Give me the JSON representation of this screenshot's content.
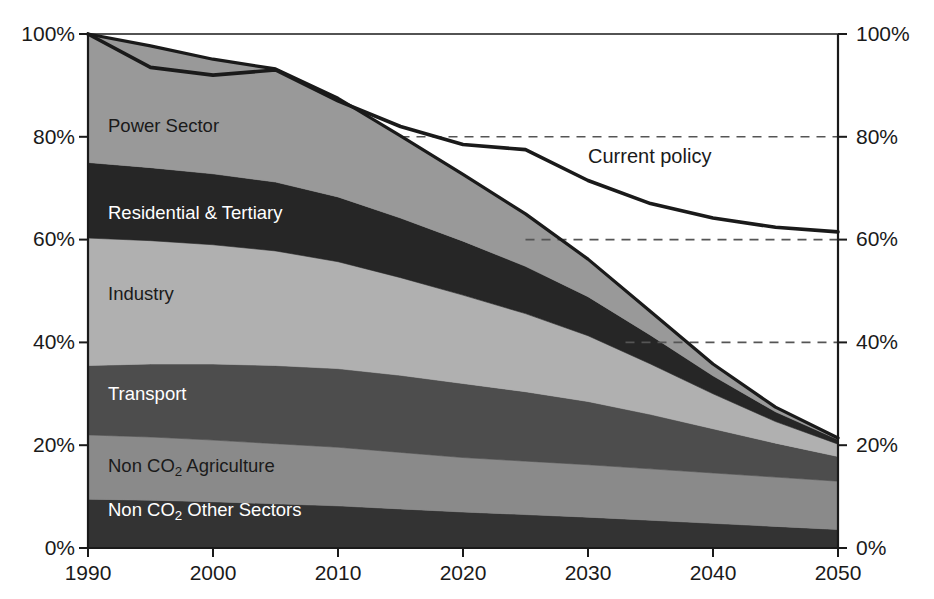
{
  "chart_data": {
    "type": "area",
    "title": "",
    "subtitle": "",
    "xlabel": "",
    "ylabel": "",
    "xlim": [
      1990,
      2050
    ],
    "ylim": [
      0,
      100
    ],
    "x": [
      1990,
      1995,
      2000,
      2005,
      2010,
      2015,
      2020,
      2025,
      2030,
      2035,
      2040,
      2045,
      2050
    ],
    "xticks": [
      "1990",
      "2000",
      "2010",
      "2020",
      "2030",
      "2040",
      "2050"
    ],
    "yticks_left": [
      "0%",
      "20%",
      "40%",
      "60%",
      "80%",
      "100%"
    ],
    "yticks_right": [
      "0%",
      "20%",
      "40%",
      "60%",
      "80%",
      "100%"
    ],
    "grid": "dashed horizontal gridlines at 40%, 60% and 80% on right half only",
    "legend_position": "inline band labels",
    "stack_order_bottom_to_top": [
      "Non CO2 Other Sectors",
      "Non CO2 Agriculture",
      "Transport",
      "Industry",
      "Residential & Tertiary",
      "Power Sector"
    ],
    "series": [
      {
        "name": "Non CO2 Other Sectors",
        "label": "Non CO",
        "label_sub": "2",
        "label_tail": " Other Sectors",
        "color": "#333333",
        "text_color": "#ffffff",
        "values": [
          9.5,
          9.3,
          9.0,
          8.6,
          8.2,
          7.6,
          7.0,
          6.5,
          6.0,
          5.4,
          4.8,
          4.2,
          3.6
        ]
      },
      {
        "name": "Non CO2 Agriculture",
        "label": "Non CO",
        "label_sub": "2",
        "label_tail": " Agriculture",
        "color": "#8a8a8a",
        "text_color": "#1a1a1a",
        "values": [
          12.5,
          12.3,
          12.0,
          11.7,
          11.4,
          11.0,
          10.6,
          10.4,
          10.2,
          10.0,
          9.8,
          9.6,
          9.4
        ]
      },
      {
        "name": "Transport",
        "label": "Transport",
        "color": "#4d4d4d",
        "text_color": "#ffffff",
        "values": [
          13.5,
          14.2,
          14.8,
          15.2,
          15.3,
          15.0,
          14.4,
          13.5,
          12.3,
          10.6,
          8.6,
          6.6,
          4.8
        ]
      },
      {
        "name": "Industry",
        "label": "Industry",
        "color": "#b0b0b0",
        "text_color": "#1a1a1a",
        "values": [
          24.8,
          24.0,
          23.2,
          22.3,
          20.8,
          19.0,
          17.2,
          15.2,
          12.8,
          9.8,
          6.8,
          4.2,
          2.4
        ]
      },
      {
        "name": "Residential & Tertiary",
        "label": "Residential & Tertiary",
        "color": "#262626",
        "text_color": "#ffffff",
        "values": [
          14.7,
          14.2,
          13.8,
          13.4,
          12.6,
          11.6,
          10.5,
          9.2,
          7.6,
          5.6,
          3.5,
          1.9,
          0.9
        ]
      },
      {
        "name": "Power Sector",
        "label": "Power Sector",
        "color": "#999999",
        "text_color": "#1a1a1a",
        "values": [
          25.0,
          23.7,
          22.3,
          22.0,
          19.2,
          16.0,
          13.0,
          10.2,
          7.3,
          4.6,
          2.3,
          0.9,
          0.3
        ]
      }
    ],
    "total_line": {
      "name": "Total emissions (stack top)",
      "color": "#1a1a1a",
      "values": [
        100.0,
        97.7,
        95.1,
        93.2,
        87.5,
        80.2,
        72.7,
        65.0,
        56.2,
        46.0,
        35.8,
        27.4,
        21.4
      ]
    },
    "overlay_line": {
      "name": "Current policy",
      "label": "Current policy",
      "color": "#1a1a1a",
      "x": [
        1990,
        1995,
        2000,
        2005,
        2010,
        2015,
        2020,
        2025,
        2030,
        2035,
        2040,
        2045,
        2050
      ],
      "values": [
        100.0,
        93.5,
        92.0,
        93.0,
        87.0,
        82.0,
        78.5,
        77.5,
        71.5,
        67.0,
        64.2,
        62.4,
        61.5
      ]
    },
    "gridlines": [
      {
        "value": 80,
        "style": "dashed",
        "x_from": 2015,
        "x_to": 2050
      },
      {
        "value": 60,
        "style": "dashed",
        "x_from": 2025,
        "x_to": 2050
      },
      {
        "value": 40,
        "style": "dashed",
        "x_from": 2033,
        "x_to": 2050
      }
    ]
  },
  "axes": {
    "left_ticks": [
      "100%",
      "80%",
      "60%",
      "40%",
      "20%",
      "0%"
    ],
    "right_ticks": [
      "100%",
      "80%",
      "60%",
      "40%",
      "20%",
      "0%"
    ],
    "x_ticks": [
      "1990",
      "2000",
      "2010",
      "2020",
      "2030",
      "2040",
      "2050"
    ]
  },
  "band_labels": {
    "power_sector": "Power Sector",
    "residential_tertiary": "Residential & Tertiary",
    "industry": "Industry",
    "transport": "Transport",
    "non_co2_agriculture_pre": "Non CO",
    "non_co2_agriculture_sub": "2",
    "non_co2_agriculture_post": " Agriculture",
    "non_co2_other_pre": "Non CO",
    "non_co2_other_sub": "2",
    "non_co2_other_post": " Other Sectors",
    "current_policy": "Current policy"
  }
}
